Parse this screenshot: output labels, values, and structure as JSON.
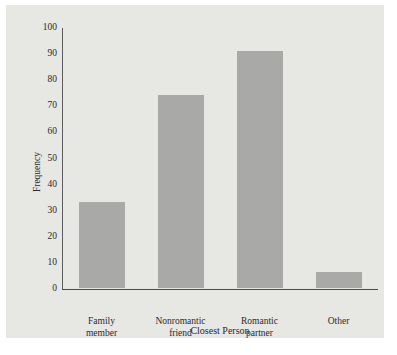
{
  "chart_data": {
    "type": "bar",
    "title": "",
    "xlabel": "Closest Person",
    "ylabel": "Frequency",
    "categories": [
      "Family member",
      "Nonromantic friend",
      "Romantic partner",
      "Other"
    ],
    "category_lines": [
      [
        "Family",
        "member"
      ],
      [
        "Nonromantic",
        "friend"
      ],
      [
        "Romantic",
        "partner"
      ],
      [
        "Other",
        ""
      ]
    ],
    "values": [
      33,
      74,
      91,
      6
    ],
    "ylim": [
      0,
      100
    ],
    "yticks": [
      0,
      10,
      20,
      30,
      40,
      50,
      60,
      70,
      80,
      90,
      100
    ],
    "ytick_labels": [
      "0",
      "10",
      "20",
      "30",
      "40",
      "50",
      "60",
      "70",
      "80",
      "90",
      "100"
    ],
    "grid": false,
    "legend": "none",
    "colors": {
      "bar": "#a9a9a7",
      "panel_background": "#e7e7e4",
      "page_background": "#ffffff",
      "axis": "#4a4a4a",
      "text": "#2b2b2b"
    }
  }
}
